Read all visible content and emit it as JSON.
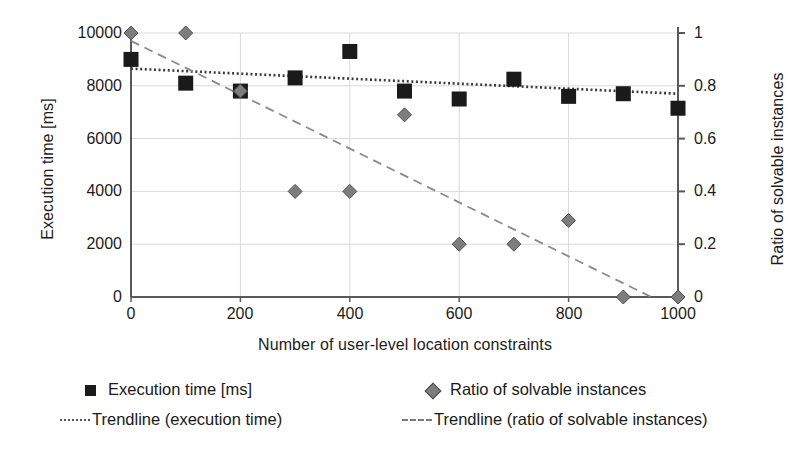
{
  "chart_data": {
    "type": "scatter",
    "title": "",
    "xlabel": "Number of user-level location constraints",
    "ylabel": "Execution time [ms]",
    "y2label": "Ratio of solvable instances",
    "xlim": [
      0,
      1000
    ],
    "ylim": [
      0,
      10000
    ],
    "y2lim": [
      0,
      1
    ],
    "grid": true,
    "legend_position": "bottom",
    "x": [
      0,
      100,
      200,
      300,
      400,
      500,
      600,
      700,
      800,
      900,
      1000
    ],
    "xticks": [
      "0",
      "200",
      "400",
      "600",
      "800",
      "1000"
    ],
    "xtick_values": [
      0,
      200,
      400,
      600,
      800,
      1000
    ],
    "yticks": [
      "0",
      "2000",
      "4000",
      "6000",
      "8000",
      "10000"
    ],
    "ytick_values": [
      0,
      2000,
      4000,
      6000,
      8000,
      10000
    ],
    "y2ticks": [
      "0",
      "0.2",
      "0.4",
      "0.6",
      "0.8",
      "1"
    ],
    "y2tick_values": [
      0,
      0.2,
      0.4,
      0.6,
      0.8,
      1
    ],
    "series": [
      {
        "name": "Execution time [ms]",
        "axis": "left",
        "marker": "square",
        "color": "#1a1a1a",
        "values": [
          9000,
          8100,
          7800,
          8300,
          9300,
          7800,
          7500,
          8250,
          7600,
          7700,
          7150
        ]
      },
      {
        "name": "Ratio of solvable instances",
        "axis": "right",
        "marker": "diamond",
        "color": "#7d7d7d",
        "values": [
          1.0,
          1.0,
          0.78,
          0.4,
          0.4,
          0.69,
          0.2,
          0.2,
          0.29,
          0.0,
          0.0
        ]
      }
    ],
    "trendlines": [
      {
        "name": "Trendline (execution time)",
        "axis": "left",
        "style": "dotted",
        "color": "#3a3a3a",
        "x_start": 0,
        "y_start": 8650,
        "x_end": 1000,
        "y_end": 7700
      },
      {
        "name": "Trendline (ratio of solvable instances)",
        "axis": "right",
        "style": "dashed",
        "color": "#8a8a8a",
        "x_start": 0,
        "y_start": 0.97,
        "x_end": 1000,
        "y_end": -0.05
      }
    ]
  },
  "axes": {
    "y_left_title": "Execution time [ms]",
    "y_right_title": "Ratio of solvable instances",
    "x_title": "Number of user-level location constraints",
    "y_left_ticks": [
      "10000",
      "8000",
      "6000",
      "4000",
      "2000",
      "0"
    ],
    "y_right_ticks": [
      "1",
      "0.8",
      "0.6",
      "0.4",
      "0.2",
      "0"
    ],
    "x_ticks": [
      "0",
      "200",
      "400",
      "600",
      "800",
      "1000"
    ]
  },
  "legend": {
    "items": [
      {
        "label": "Execution time [ms]",
        "marker": "square-marker"
      },
      {
        "label": "Ratio of solvable instances",
        "marker": "diamond-marker"
      },
      {
        "label": "Trendline (execution time)",
        "marker": "dotted-line"
      },
      {
        "label": "Trendline (ratio of solvable instances)",
        "marker": "dashed-line"
      }
    ]
  },
  "colors": {
    "series_exec": "#1a1a1a",
    "series_ratio": "#7d7d7d",
    "grid": "#d9d9d9",
    "axis": "#595959",
    "background": "#ffffff"
  }
}
